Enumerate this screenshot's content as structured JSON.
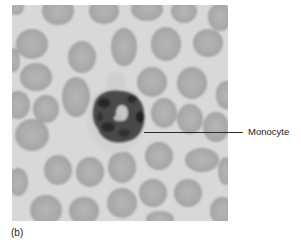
{
  "figure": {
    "panel_label": "(b)",
    "callouts": [
      {
        "label": "Monocyte"
      }
    ],
    "photo": {
      "subject": "blood smear micrograph with monocyte surrounded by red blood cells",
      "colors": {
        "background": "#d6d6d6",
        "red_blood_cell": "#a9a9a9",
        "rbc_center": "#b4b4b4",
        "cytoplasm": "#cfcfcf",
        "nucleus": "#3a3a3a",
        "leader_line": "#2a2a2a"
      }
    }
  }
}
